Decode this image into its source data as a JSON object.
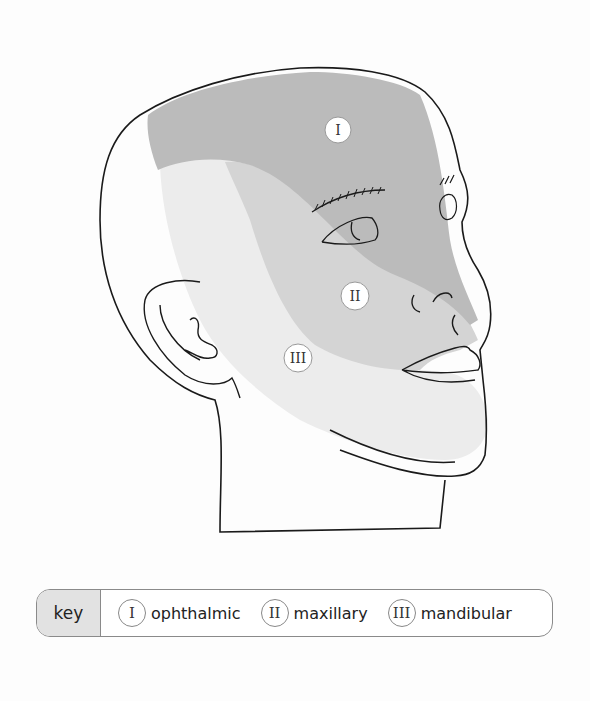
{
  "diagram": {
    "type": "anatomical-illustration",
    "regions": [
      {
        "id": "I",
        "numeral": "I",
        "name": "ophthalmic",
        "shade": "#bdbdbd"
      },
      {
        "id": "II",
        "numeral": "II",
        "name": "maxillary",
        "shade": "#d6d6d6"
      },
      {
        "id": "III",
        "numeral": "III",
        "name": "mandibular",
        "shade": "#e8e8e8"
      }
    ]
  },
  "key": {
    "title": "key",
    "items": [
      {
        "numeral": "I",
        "label": "ophthalmic"
      },
      {
        "numeral": "II",
        "label": "maxillary"
      },
      {
        "numeral": "III",
        "label": "mandibular"
      }
    ]
  }
}
